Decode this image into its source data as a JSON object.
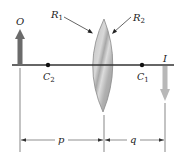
{
  "diagram": {
    "type": "thin converging lens ray geometry",
    "labels": {
      "object": "O",
      "image": "I",
      "radius1": "R",
      "radius1_sub": "1",
      "radius2": "R",
      "radius2_sub": "2",
      "center1": "C",
      "center1_sub": "1",
      "center2": "C",
      "center2_sub": "2",
      "object_distance": "p",
      "image_distance": "q"
    },
    "colors": {
      "object_arrow": "#6b6b6b",
      "image_arrow": "#b8b8b8",
      "axis": "#333333",
      "lens_fill": "#c4c4c4",
      "lens_stroke": "#8a8a8a",
      "dimension_line": "#444444"
    }
  }
}
